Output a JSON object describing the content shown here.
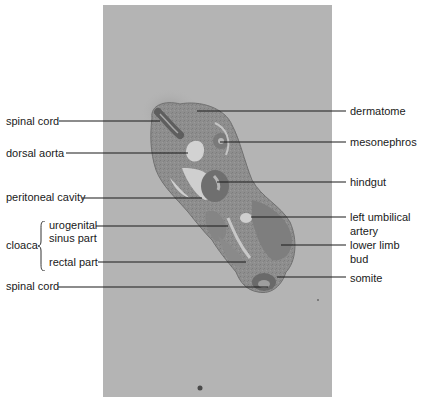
{
  "figure": {
    "type": "histology-section-diagram",
    "colors": {
      "background": "#ffffff",
      "slide": "#b4b4b4",
      "tissue": "#8c8c8c",
      "tissue_dark": "#6e6e6e",
      "leader_line": "#1a1a1a"
    },
    "left_labels": [
      {
        "text": "spinal cord",
        "x": 6,
        "y": 121
      },
      {
        "text": "dorsal aorta",
        "x": 6,
        "y": 153
      },
      {
        "text": "peritoneal cavity",
        "x": 6,
        "y": 197
      },
      {
        "text": "urogenital",
        "x": 49,
        "y": 225
      },
      {
        "text": "sinus part",
        "x": 49,
        "y": 238
      },
      {
        "text": "rectal part",
        "x": 49,
        "y": 262
      },
      {
        "text": "spinal cord",
        "x": 6,
        "y": 286
      }
    ],
    "group_label": {
      "text": "cloaca",
      "x": 6,
      "y": 245
    },
    "right_labels": [
      {
        "text": "dermatome",
        "y": 111
      },
      {
        "text": "mesonephros",
        "y": 142
      },
      {
        "text": "hindgut",
        "y": 182
      },
      {
        "text": "left umbilical",
        "y": 217
      },
      {
        "text": "artery",
        "y": 231
      },
      {
        "text": "lower limb",
        "y": 245
      },
      {
        "text": "bud",
        "y": 259
      },
      {
        "text": "somite",
        "y": 278
      }
    ],
    "leader_lines": [
      {
        "name": "spinal-cord-upper",
        "x1": 59,
        "y1": 121,
        "x2": 160,
        "y2": 121
      },
      {
        "name": "dorsal-aorta",
        "x1": 66,
        "y1": 153,
        "x2": 188,
        "y2": 153
      },
      {
        "name": "peritoneal-cavity",
        "x1": 82,
        "y1": 198,
        "x2": 202,
        "y2": 198
      },
      {
        "name": "urogenital-sinus",
        "x1": 96,
        "y1": 226,
        "x2": 228,
        "y2": 226
      },
      {
        "name": "rectal-part",
        "x1": 98,
        "y1": 262,
        "x2": 246,
        "y2": 262
      },
      {
        "name": "spinal-cord-lower",
        "x1": 58,
        "y1": 287,
        "x2": 268,
        "y2": 287
      },
      {
        "name": "dermatome",
        "x1": 197,
        "y1": 111,
        "x2": 346,
        "y2": 111
      },
      {
        "name": "mesonephros",
        "x1": 220,
        "y1": 142,
        "x2": 346,
        "y2": 142
      },
      {
        "name": "hindgut",
        "x1": 217,
        "y1": 182,
        "x2": 346,
        "y2": 182
      },
      {
        "name": "left-umbilical-artery",
        "x1": 251,
        "y1": 217,
        "x2": 346,
        "y2": 217
      },
      {
        "name": "lower-limb-bud",
        "x1": 281,
        "y1": 245,
        "x2": 346,
        "y2": 245
      },
      {
        "name": "somite",
        "x1": 277,
        "y1": 277,
        "x2": 346,
        "y2": 277
      }
    ]
  }
}
